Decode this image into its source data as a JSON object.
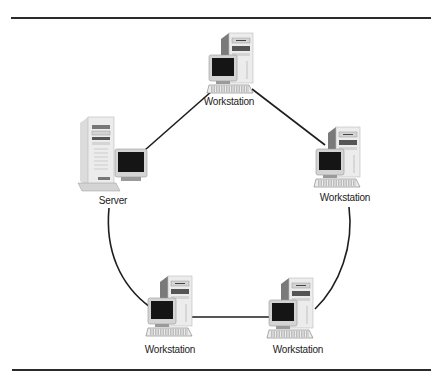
{
  "diagram": {
    "type": "ring-network",
    "rules": {
      "top": {
        "x1": 11,
        "x2": 431,
        "y": 17
      },
      "bottom": {
        "x1": 12,
        "x2": 431,
        "y": 369
      }
    },
    "colors": {
      "line": "#1e1e1e",
      "case_light": "#ececec",
      "case_mid": "#d4d4d4",
      "case_dark": "#9a9a9a",
      "case_shadow": "#7a7a7a",
      "screen": "#151515",
      "label": "#222222"
    },
    "nodes": [
      {
        "id": "ws-top",
        "kind": "workstation",
        "label": "Workstation",
        "x": 229,
        "y": 33,
        "label_x": 229,
        "label_y": 96
      },
      {
        "id": "server",
        "kind": "server",
        "label": "Server",
        "x": 80,
        "y": 117,
        "label_x": 113,
        "label_y": 195
      },
      {
        "id": "ws-right",
        "kind": "workstation",
        "label": "Workstation",
        "x": 336,
        "y": 127,
        "label_x": 345,
        "label_y": 192
      },
      {
        "id": "ws-bottom-left",
        "kind": "workstation",
        "label": "Workstation",
        "x": 168,
        "y": 276,
        "label_x": 170,
        "label_y": 344
      },
      {
        "id": "ws-bottom-right",
        "kind": "workstation",
        "label": "Workstation",
        "x": 289,
        "y": 278,
        "label_x": 298,
        "label_y": 344
      }
    ],
    "links": [
      {
        "from": "server",
        "to": "ws-top",
        "path": "M145 150 L212 91"
      },
      {
        "from": "ws-top",
        "to": "ws-right",
        "path": "M252 89 L325 145"
      },
      {
        "from": "ws-right",
        "to": "ws-bottom-right",
        "path": "M349 207 C354 245 340 285 315 309"
      },
      {
        "from": "ws-bottom-right",
        "to": "ws-bottom-left",
        "path": "M272 317 L192 317"
      },
      {
        "from": "ws-bottom-left",
        "to": "server",
        "path": "M150 307 C120 285 105 250 109 208"
      }
    ]
  }
}
